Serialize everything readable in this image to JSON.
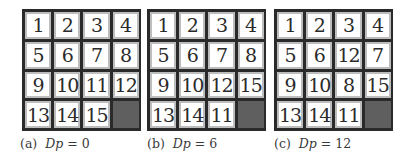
{
  "figure": {
    "panels": [
      {
        "label": "(a)",
        "var": "Dp",
        "eq": "= 0",
        "tiles": [
          "1",
          "2",
          "3",
          "4",
          "5",
          "6",
          "7",
          "8",
          "9",
          "10",
          "11",
          "12",
          "13",
          "14",
          "15",
          ""
        ]
      },
      {
        "label": "(b)",
        "var": "Dp",
        "eq": "= 6",
        "tiles": [
          "1",
          "2",
          "3",
          "4",
          "5",
          "6",
          "7",
          "8",
          "9",
          "10",
          "12",
          "15",
          "13",
          "14",
          "11",
          ""
        ]
      },
      {
        "label": "(c)",
        "var": "Dp",
        "eq": "= 12",
        "tiles": [
          "1",
          "2",
          "3",
          "4",
          "5",
          "6",
          "12",
          "7",
          "9",
          "10",
          "8",
          "15",
          "13",
          "14",
          "11",
          ""
        ]
      }
    ],
    "colors": {
      "frame": "#2a2a2a",
      "tile": "#ffffff",
      "blank": "#5f5f5f"
    }
  }
}
